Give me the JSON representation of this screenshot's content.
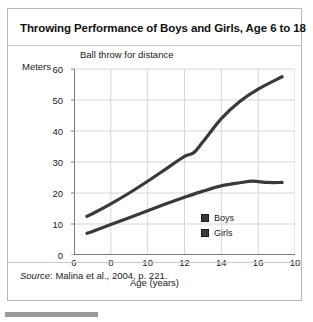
{
  "figure": {
    "title": "Throwing Performance of Boys and Girls, Age 6 to 18",
    "subtitle": "Ball throw for distance",
    "source_word": "Source",
    "source_rest": ": Malina et al., 2004, p. 221."
  },
  "legend": {
    "position": "inside-bottom-right",
    "entries": [
      {
        "label": "Boys",
        "color": "#3a3a3a"
      },
      {
        "label": "Girls",
        "color": "#3a3a3a"
      }
    ]
  },
  "chart_data": {
    "type": "line",
    "title": "Ball throw for distance",
    "xlabel": "Age (years)",
    "ylabel": "Meters",
    "xlim": [
      6,
      18
    ],
    "ylim": [
      0,
      60
    ],
    "xticks": [
      6,
      8,
      10,
      12,
      14,
      16,
      18
    ],
    "yticks": [
      0,
      10,
      20,
      30,
      40,
      50,
      60
    ],
    "grid": true,
    "legend_position": "inside-bottom-right",
    "series": [
      {
        "name": "Boys",
        "color": "#3a3a3a",
        "x": [
          6.7,
          7,
          8,
          9,
          10,
          11,
          12,
          12.5,
          13,
          14,
          15,
          16,
          17.3
        ],
        "values": [
          12.5,
          13.3,
          16.5,
          20.0,
          23.8,
          27.8,
          31.8,
          33.0,
          36.5,
          44.0,
          49.5,
          53.5,
          57.5
        ]
      },
      {
        "name": "Girls",
        "color": "#3a3a3a",
        "x": [
          6.7,
          7,
          8,
          9,
          10,
          11,
          12,
          13,
          14,
          15,
          15.7,
          16.5,
          17.3
        ],
        "values": [
          7.0,
          7.6,
          9.8,
          12.0,
          14.3,
          16.5,
          18.6,
          20.6,
          22.3,
          23.3,
          23.8,
          23.4,
          23.4
        ]
      }
    ]
  },
  "axis": {
    "x_tick_labels": [
      "6",
      "8",
      "10",
      "12",
      "14",
      "16",
      "18"
    ],
    "y_tick_labels": [
      "0",
      "10",
      "20",
      "30",
      "40",
      "50",
      "60"
    ],
    "x_title": "Age (years)",
    "y_title": "Meters"
  }
}
